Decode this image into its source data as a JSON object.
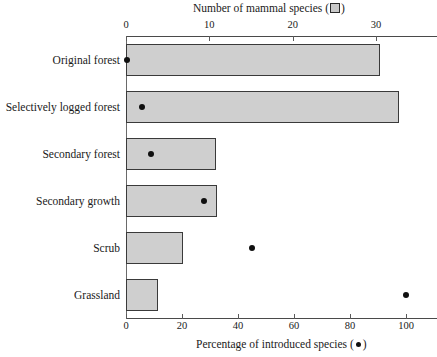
{
  "chart_data": {
    "type": "bar",
    "title": "",
    "orientation": "horizontal",
    "categories": [
      "Original forest",
      "Selectively logged forest",
      "Secondary forest",
      "Secondary growth",
      "Scrub",
      "Grassland"
    ],
    "series": [
      {
        "name": "Number of mammal species",
        "marker": "square",
        "axis": "top",
        "values": [
          30.5,
          32.8,
          10.8,
          10.9,
          6.8,
          3.8
        ]
      },
      {
        "name": "Percentage of introduced species",
        "marker": "circle",
        "axis": "bottom",
        "values": [
          0.5,
          5.7,
          9.0,
          28.0,
          45.0,
          100.0
        ]
      }
    ],
    "top_axis": {
      "label": "Number of mammal species (▣)",
      "label_text": "Number of mammal species",
      "ticks": [
        0,
        10,
        20,
        30
      ],
      "ticklabels": [
        "0",
        "10",
        "20",
        "30"
      ],
      "range": [
        0,
        33.6
      ]
    },
    "bottom_axis": {
      "label": "Percentage of introduced species (●)",
      "label_text": "Percentage of introduced species",
      "ticks": [
        0,
        20,
        40,
        60,
        80,
        100
      ],
      "ticklabels": [
        "0",
        "20",
        "40",
        "60",
        "80",
        "100"
      ],
      "range": [
        0,
        100
      ]
    },
    "grid": false,
    "legend": "inline-in-axis-titles",
    "colors": {
      "bar_fill": "#cfcfcf",
      "bar_stroke": "#3a3a3a",
      "dot": "#101010",
      "axis": "#4a4a4a",
      "text": "#1a1a1a",
      "background": "#ffffff"
    }
  },
  "axes": {
    "top_title_prefix": "Number of mammal species (",
    "top_title_suffix": ")",
    "bottom_title_prefix": "Percentage of introduced species (",
    "bottom_title_suffix": ")"
  },
  "tick_labels": {
    "top": [
      "0",
      "10",
      "20",
      "30"
    ],
    "bottom": [
      "0",
      "20",
      "40",
      "60",
      "80",
      "100"
    ]
  },
  "category_labels": [
    "Original forest",
    "Selectively logged forest",
    "Secondary forest",
    "Secondary growth",
    "Scrub",
    "Grassland"
  ]
}
